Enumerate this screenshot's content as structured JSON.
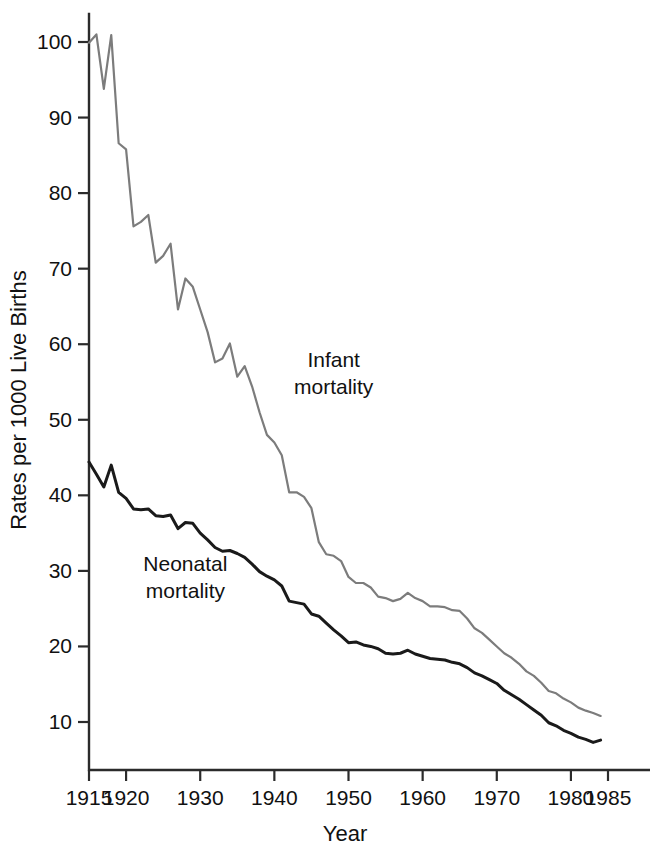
{
  "chart_data": {
    "type": "line",
    "title": "",
    "xlabel": "Year",
    "ylabel": "Rates per 1000 Live Births",
    "xlim": [
      1915,
      1985
    ],
    "ylim": [
      0,
      104
    ],
    "grid": false,
    "legend_position": "inline-annotation",
    "x_ticks": [
      1915,
      1920,
      1930,
      1940,
      1950,
      1960,
      1970,
      1980,
      1985
    ],
    "x_tick_labels": [
      "1915",
      "1920",
      "1930",
      "1940",
      "1950",
      "1960",
      "1970",
      "1980",
      "1985"
    ],
    "y_ticks": [
      10,
      20,
      30,
      40,
      50,
      60,
      70,
      80,
      90,
      100
    ],
    "y_tick_labels": [
      "10",
      "20",
      "30",
      "40",
      "50",
      "60",
      "70",
      "80",
      "90",
      "100"
    ],
    "annotations": [
      {
        "text_line1": "Infant",
        "text_line2": "mortality",
        "x": 1948,
        "y": 57,
        "color": "#7c7c7c"
      },
      {
        "text_line1": "Neonatal",
        "text_line2": "mortality",
        "x": 1928,
        "y": 30,
        "color": "#1a1a1a"
      }
    ],
    "series": [
      {
        "name": "Infant mortality",
        "color": "#7c7c7c",
        "line_width": 2.2,
        "x": [
          1915,
          1916,
          1917,
          1918,
          1919,
          1920,
          1921,
          1922,
          1923,
          1924,
          1925,
          1926,
          1927,
          1928,
          1929,
          1930,
          1931,
          1932,
          1933,
          1934,
          1935,
          1936,
          1937,
          1938,
          1939,
          1940,
          1941,
          1942,
          1943,
          1944,
          1945,
          1946,
          1947,
          1948,
          1949,
          1950,
          1951,
          1952,
          1953,
          1954,
          1955,
          1956,
          1957,
          1958,
          1959,
          1960,
          1961,
          1962,
          1963,
          1964,
          1965,
          1966,
          1967,
          1968,
          1969,
          1970,
          1971,
          1972,
          1973,
          1974,
          1975,
          1976,
          1977,
          1978,
          1979,
          1980,
          1981,
          1982,
          1983,
          1984
        ],
        "values": [
          99.9,
          101.0,
          93.8,
          100.9,
          86.6,
          85.8,
          75.6,
          76.2,
          77.1,
          70.8,
          71.7,
          73.3,
          64.6,
          68.7,
          67.6,
          64.6,
          61.6,
          57.6,
          58.1,
          60.1,
          55.7,
          57.1,
          54.4,
          51.0,
          48.0,
          47.0,
          45.3,
          40.4,
          40.4,
          39.8,
          38.3,
          33.8,
          32.2,
          32.0,
          31.3,
          29.2,
          28.4,
          28.4,
          27.8,
          26.6,
          26.4,
          26.0,
          26.3,
          27.1,
          26.4,
          26.0,
          25.3,
          25.3,
          25.2,
          24.8,
          24.7,
          23.7,
          22.4,
          21.8,
          20.9,
          20.0,
          19.1,
          18.5,
          17.7,
          16.7,
          16.1,
          15.2,
          14.1,
          13.8,
          13.1,
          12.6,
          11.9,
          11.5,
          11.2,
          10.8
        ]
      },
      {
        "name": "Neonatal mortality",
        "color": "#1a1a1a",
        "line_width": 3.0,
        "x": [
          1915,
          1916,
          1917,
          1918,
          1919,
          1920,
          1921,
          1922,
          1923,
          1924,
          1925,
          1926,
          1927,
          1928,
          1929,
          1930,
          1931,
          1932,
          1933,
          1934,
          1935,
          1936,
          1937,
          1938,
          1939,
          1940,
          1941,
          1942,
          1943,
          1944,
          1945,
          1946,
          1947,
          1948,
          1949,
          1950,
          1951,
          1952,
          1953,
          1954,
          1955,
          1956,
          1957,
          1958,
          1959,
          1960,
          1961,
          1962,
          1963,
          1964,
          1965,
          1966,
          1967,
          1968,
          1969,
          1970,
          1971,
          1972,
          1973,
          1974,
          1975,
          1976,
          1977,
          1978,
          1979,
          1980,
          1981,
          1982,
          1983,
          1984
        ],
        "values": [
          44.4,
          42.8,
          41.1,
          44.0,
          40.4,
          39.6,
          38.2,
          38.1,
          38.2,
          37.3,
          37.2,
          37.4,
          35.6,
          36.4,
          36.3,
          35.0,
          34.1,
          33.1,
          32.6,
          32.7,
          32.3,
          31.8,
          30.9,
          29.9,
          29.3,
          28.8,
          28.0,
          26.0,
          25.8,
          25.6,
          24.3,
          24.0,
          23.1,
          22.2,
          21.4,
          20.5,
          20.6,
          20.2,
          20.0,
          19.7,
          19.1,
          19.0,
          19.1,
          19.5,
          19.0,
          18.7,
          18.4,
          18.3,
          18.2,
          17.9,
          17.7,
          17.2,
          16.5,
          16.1,
          15.6,
          15.1,
          14.2,
          13.6,
          13.0,
          12.3,
          11.6,
          10.9,
          9.9,
          9.5,
          8.9,
          8.5,
          8.0,
          7.7,
          7.3,
          7.6
        ]
      }
    ]
  },
  "axes": {
    "x_axis_label": "Year",
    "y_axis_label": "Rates per 1000 Live Births"
  }
}
